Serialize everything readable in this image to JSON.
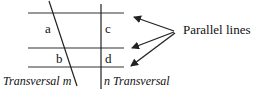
{
  "diagram": {
    "parallel_lines": {
      "count": 3,
      "y_positions": [
        13,
        48,
        67
      ],
      "x_start": 28,
      "x_end": 124
    },
    "transversals": [
      {
        "name": "m",
        "label": "Transversal m",
        "type": "slanted"
      },
      {
        "name": "n",
        "label": "n Transversal",
        "type": "vertical"
      }
    ],
    "angle_labels": [
      {
        "id": "a",
        "text": "a"
      },
      {
        "id": "b",
        "text": "b"
      },
      {
        "id": "c",
        "text": "c"
      },
      {
        "id": "d",
        "text": "d"
      }
    ],
    "callout": {
      "text": "Parallel lines",
      "arrow_count": 3
    },
    "colors": {
      "line": "#222222",
      "text": "#111111",
      "background": "#ffffff"
    }
  }
}
